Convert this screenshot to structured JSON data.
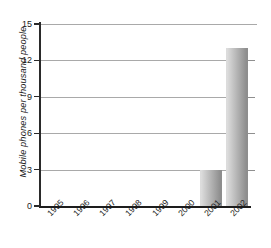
{
  "chart_data": {
    "type": "bar",
    "title": "",
    "xlabel": "",
    "ylabel": "Mobile phones per thousand people",
    "categories": [
      "1995",
      "1996",
      "1997",
      "1998",
      "1999",
      "2000",
      "2001",
      "2002"
    ],
    "values": [
      0,
      0,
      0,
      0,
      0,
      0,
      3,
      13
    ],
    "ylim": [
      0,
      15
    ],
    "yticks": [
      0,
      3,
      6,
      9,
      12,
      15
    ],
    "ytick_labels": [
      "0",
      "3",
      "6",
      "9",
      "12",
      "15"
    ],
    "grid": "horizontal",
    "legend": "none",
    "bar_fill": {
      "gradient_from": "#dcdcdc",
      "gradient_to": "#8e8e8e",
      "direction": "left-to-right"
    },
    "axis_color": "#1d1d1d",
    "gridline_color": "#a9a9a9",
    "background": "#ffffff"
  }
}
